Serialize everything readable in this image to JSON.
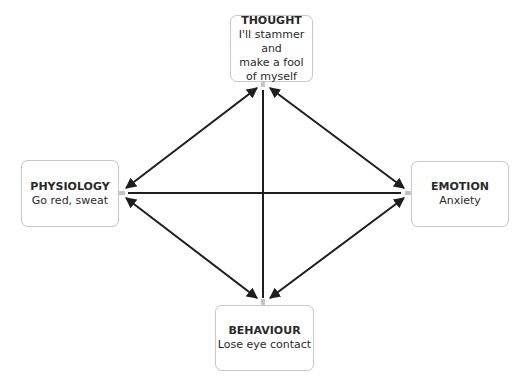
{
  "diagram": {
    "type": "cbt-cycle",
    "colors": {
      "box_border": "#c9c9c9",
      "arrow": "#1e1e1e",
      "text": "#2a2a2a"
    },
    "nodes": [
      {
        "id": "thought",
        "title": "THOUGHT",
        "body": "I'll stammer and\nmake a fool\nof myself"
      },
      {
        "id": "physiology",
        "title": "PHYSIOLOGY",
        "body": "Go red, sweat"
      },
      {
        "id": "emotion",
        "title": "EMOTION",
        "body": "Anxiety"
      },
      {
        "id": "behaviour",
        "title": "BEHAVIOUR",
        "body": "Lose eye contact"
      }
    ],
    "edges": [
      {
        "from": "thought",
        "to": "physiology",
        "arrows": "both"
      },
      {
        "from": "thought",
        "to": "emotion",
        "arrows": "both"
      },
      {
        "from": "physiology",
        "to": "behaviour",
        "arrows": "both"
      },
      {
        "from": "emotion",
        "to": "behaviour",
        "arrows": "both"
      },
      {
        "from": "thought",
        "to": "behaviour",
        "arrows": "none"
      },
      {
        "from": "physiology",
        "to": "emotion",
        "arrows": "none"
      }
    ]
  }
}
